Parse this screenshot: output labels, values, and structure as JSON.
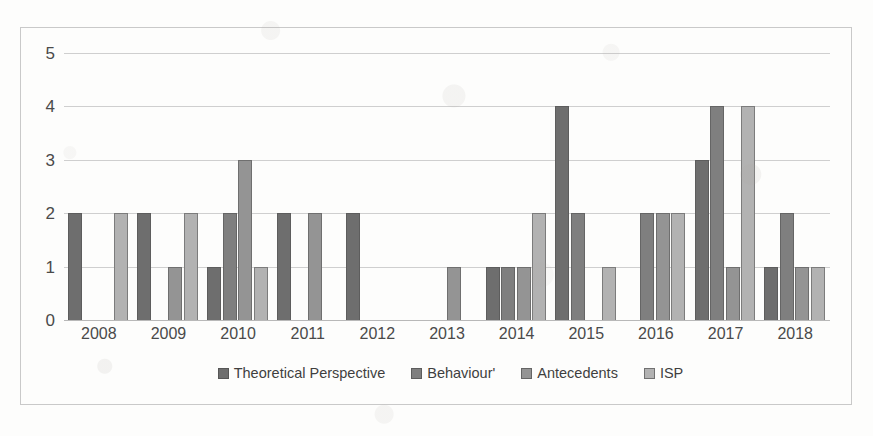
{
  "chart_data": {
    "type": "bar",
    "title": "",
    "subtitle": "",
    "xlabel": "",
    "ylabel": "",
    "ylim": [
      0,
      5
    ],
    "ytick_values": [
      0,
      1,
      2,
      3,
      4,
      5
    ],
    "ytick_labels": [
      "0",
      "1",
      "2",
      "3",
      "4",
      "5"
    ],
    "grid": true,
    "grid_axis": "y",
    "legend_position": "bottom",
    "categories": [
      "2008",
      "2009",
      "2010",
      "2011",
      "2012",
      "2013",
      "2014",
      "2015",
      "2016",
      "2017",
      "2018"
    ],
    "series": [
      {
        "name": "Theoretical Perspective",
        "color": "#6e6e6e",
        "values": [
          2,
          2,
          1,
          2,
          2,
          0,
          1,
          4,
          0,
          3,
          1
        ]
      },
      {
        "name": "Behaviour'",
        "color": "#7f7f7f",
        "values": [
          0,
          0,
          2,
          0,
          0,
          0,
          1,
          2,
          2,
          4,
          2
        ]
      },
      {
        "name": "Antecedents",
        "color": "#949494",
        "values": [
          0,
          1,
          3,
          2,
          0,
          1,
          1,
          0,
          2,
          1,
          1
        ]
      },
      {
        "name": "ISP",
        "color": "#b2b2b2",
        "values": [
          2,
          2,
          1,
          0,
          0,
          0,
          2,
          1,
          2,
          4,
          1
        ]
      }
    ]
  },
  "legend": {
    "items": [
      {
        "label": "Theoretical Perspective",
        "color": "#6e6e6e"
      },
      {
        "label": "Behaviour'",
        "color": "#7f7f7f"
      },
      {
        "label": "Antecedents",
        "color": "#949494"
      },
      {
        "label": "ISP",
        "color": "#b2b2b2"
      }
    ]
  },
  "axis": {
    "y_labels": [
      "5",
      "4",
      "3",
      "2",
      "1",
      "0"
    ],
    "x_labels": [
      "2008",
      "2009",
      "2010",
      "2011",
      "2012",
      "2013",
      "2014",
      "2015",
      "2016",
      "2017",
      "2018"
    ]
  }
}
